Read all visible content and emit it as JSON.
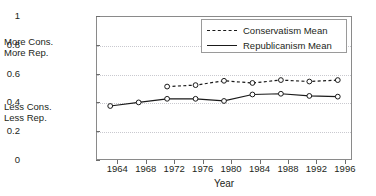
{
  "chart_data": {
    "type": "line",
    "title": "",
    "xlabel": "Year",
    "ylabel": "",
    "categories": [
      1964,
      1968,
      1972,
      1976,
      1980,
      1984,
      1988,
      1992,
      1996
    ],
    "x": [
      1964,
      1968,
      1972,
      1976,
      1980,
      1984,
      1988,
      1992,
      1996
    ],
    "xlim": [
      1962,
      1998
    ],
    "ylim": [
      0,
      1
    ],
    "ytick_labels": [
      "0",
      "0.2",
      "0.4",
      "0.6",
      "0.8",
      "1"
    ],
    "ytick_values": [
      0,
      0.2,
      0.4,
      0.6,
      0.8,
      1
    ],
    "xtick_labels": [
      "1964",
      "1968",
      "1972",
      "1976",
      "1980",
      "1984",
      "1988",
      "1992",
      "1996"
    ],
    "grid": true,
    "grid_axis": "y",
    "legend_position": "top-right",
    "markers": "open-circle",
    "series": [
      {
        "name": "Conservatism Mean",
        "style": "dashed",
        "values": [
          null,
          null,
          0.51,
          0.52,
          0.55,
          0.535,
          0.555,
          0.545,
          0.555
        ]
      },
      {
        "name": "Republicanism Mean",
        "style": "solid",
        "values": [
          0.375,
          0.4,
          0.425,
          0.425,
          0.41,
          0.455,
          0.46,
          0.445,
          0.44
        ]
      }
    ],
    "annotations": [
      {
        "id": "more",
        "line1": "More Cons.",
        "line2": "More Rep.",
        "near_value": 0.8
      },
      {
        "id": "less",
        "line1": "Less Cons.",
        "line2": "Less Rep.",
        "near_value": 0.42
      }
    ]
  },
  "colors": {
    "series_line": "#1a1a1a",
    "gridline": "#c9c9cf",
    "axis": "#8a8a8a",
    "text": "#231f20",
    "background": "#ffffff"
  }
}
